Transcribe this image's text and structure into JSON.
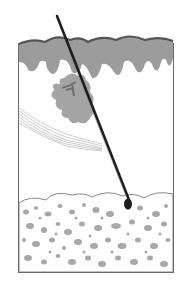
{
  "diagram": {
    "layers": [
      "epidermis",
      "dermis",
      "subcutaneous fat"
    ],
    "structures": [
      "hair shaft",
      "hair bulb",
      "sebaceous gland",
      "arrector pili muscle"
    ],
    "colors": {
      "background": "#ffffff",
      "frame": "#6a6a6a",
      "epidermis_outer": "#5a5a5a",
      "epidermis_fill": "#9c9c9c",
      "gland": "#a4a4a4",
      "gland_dark": "#6e6e6e",
      "hair": "#1e1e1e",
      "fat_cell": "#a8a8a8",
      "muscle_line": "#9a9a9a"
    }
  }
}
